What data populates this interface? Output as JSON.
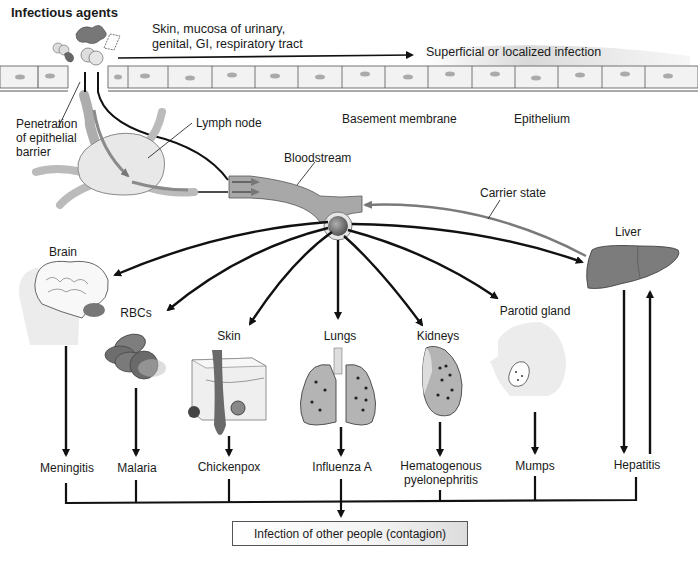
{
  "title": "Infectious agents",
  "top": {
    "entry_sites": "Skin, mucosa of urinary,\ngenital, GI, respiratory tract",
    "entry_sites_line1": "Skin, mucosa of urinary,",
    "entry_sites_line2": "genital, GI, respiratory tract",
    "superficial": "Superficial or localized infection",
    "penetration_line1": "Penetration",
    "penetration_line2": "of epithelial",
    "penetration_line3": "barrier",
    "lymph_node": "Lymph node",
    "basement_membrane": "Basement membrane",
    "epithelium": "Epithelium",
    "bloodstream": "Bloodstream",
    "carrier_state": "Carrier state"
  },
  "organs": [
    {
      "name": "Brain",
      "disease": "Meningitis"
    },
    {
      "name": "RBCs",
      "disease": "Malaria"
    },
    {
      "name": "Skin",
      "disease": "Chickenpox"
    },
    {
      "name": "Lungs",
      "disease": "Influenza A"
    },
    {
      "name": "Kidneys",
      "disease_line1": "Hematogenous",
      "disease_line2": "pyelonephritis"
    },
    {
      "name": "Parotid gland",
      "disease": "Mumps"
    },
    {
      "name": "Liver",
      "disease": "Hepatitis"
    }
  ],
  "outcome": "Infection of other people (contagion)",
  "colors": {
    "line": "#111111",
    "organ_gray": "#8a8a8a",
    "vessel_gray": "#a8a8a8",
    "tissue_light": "#e6e6e6",
    "carrier_arrow": "#7a7a7a"
  }
}
